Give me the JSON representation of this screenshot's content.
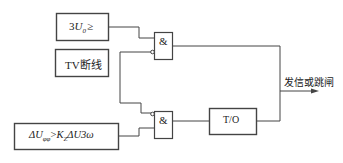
{
  "diagram": {
    "blocks": [
      {
        "id": "zero-seq-voltage",
        "label_parts": [
          "3",
          "U",
          "0",
          "≥"
        ]
      },
      {
        "id": "tv-disconnect",
        "label": "TV断线"
      },
      {
        "id": "delta-u",
        "label_parts": [
          "ΔU",
          "φφ",
          ">",
          "K",
          "Z",
          "ΔU3ω"
        ]
      },
      {
        "id": "timer",
        "label": "T/O"
      }
    ],
    "gates": [
      {
        "id": "and-gate-1",
        "label": "&"
      },
      {
        "id": "and-gate-2",
        "label": "&"
      }
    ],
    "output": {
      "label": "发信或跳闸"
    }
  }
}
